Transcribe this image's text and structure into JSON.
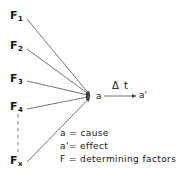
{
  "diagram": {
    "type": "causal-convergence-diagram",
    "title": "",
    "background_color": "#ffffff",
    "stroke_color": "#4d4d4d",
    "text_color": "#141414",
    "cause_node": {
      "id": "a",
      "label": "a",
      "x": 97,
      "y": 96
    },
    "effect_node": {
      "id": "a-prime",
      "label": "a'",
      "x": 139,
      "y": 96
    },
    "transition": {
      "label": "Δ t",
      "from": "a",
      "to": "a'",
      "arrow": true
    },
    "factors": [
      {
        "id": "F1",
        "base": "F",
        "sub": "1",
        "x": 10,
        "y": 10,
        "line_from_x": 27,
        "line_from_y": 19
      },
      {
        "id": "F2",
        "base": "F",
        "sub": "2",
        "x": 10,
        "y": 40,
        "line_from_x": 27,
        "line_from_y": 49
      },
      {
        "id": "F3",
        "base": "F",
        "sub": "3",
        "x": 10,
        "y": 73,
        "line_from_x": 27,
        "line_from_y": 81
      },
      {
        "id": "F4",
        "base": "F",
        "sub": "4",
        "x": 10,
        "y": 101,
        "line_from_x": 27,
        "line_from_y": 109
      },
      {
        "id": "Fx",
        "base": "F",
        "sub": "x",
        "x": 10,
        "y": 155,
        "line_from_x": 27,
        "line_from_y": 162
      }
    ],
    "ellipsis_connector": {
      "style": "dashed",
      "from": {
        "x": 18,
        "y": 114
      },
      "to": {
        "x": 18,
        "y": 152
      }
    },
    "legend": [
      "a = cause",
      "a'= effect",
      "F = determining factors"
    ]
  }
}
